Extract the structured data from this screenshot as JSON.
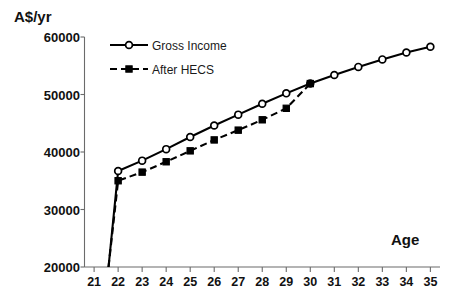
{
  "chart_data": {
    "type": "line",
    "title": "",
    "ylabel": "A$/yr",
    "xlabel": "Age",
    "x": [
      21,
      22,
      23,
      24,
      25,
      26,
      27,
      28,
      29,
      30,
      31,
      32,
      33,
      34,
      35
    ],
    "xlim": [
      20.6,
      35.4
    ],
    "ylim": [
      20000,
      60000
    ],
    "yticks": [
      20000,
      30000,
      40000,
      50000,
      60000
    ],
    "ytick_labels": [
      "20000",
      "30000",
      "40000",
      "50000",
      "60000"
    ],
    "xtick_labels": [
      "21",
      "22",
      "23",
      "24",
      "25",
      "26",
      "27",
      "28",
      "29",
      "30",
      "31",
      "32",
      "33",
      "34",
      "35"
    ],
    "grid": false,
    "legend_position": "top-left",
    "series": [
      {
        "name": "Gross Income",
        "marker": "open-circle",
        "linestyle": "solid",
        "color": "#000000",
        "x": [
          21.6,
          22,
          23,
          24,
          25,
          26,
          27,
          28,
          29,
          30,
          31,
          32,
          33,
          34,
          35
        ],
        "values": [
          20000,
          36700,
          38500,
          40500,
          42600,
          44600,
          46500,
          48400,
          50200,
          51900,
          53400,
          54800,
          56100,
          57300,
          58300
        ]
      },
      {
        "name": "After HECS",
        "marker": "filled-square",
        "linestyle": "dashed",
        "color": "#000000",
        "x": [
          21.6,
          22,
          23,
          24,
          25,
          26,
          27,
          28,
          29,
          30
        ],
        "values": [
          20000,
          35000,
          36500,
          38300,
          40200,
          42100,
          43800,
          45600,
          47600,
          51900
        ]
      }
    ],
    "legend": [
      {
        "label": "Gross Income",
        "marker": "open-circle",
        "linestyle": "solid"
      },
      {
        "label": "After HECS",
        "marker": "filled-square",
        "linestyle": "dashed"
      }
    ]
  },
  "axis": {
    "y_title": "A$/yr",
    "x_title": "Age"
  },
  "colors": {
    "ink": "#000000",
    "axis": "#6b6b6b",
    "background": "#ffffff"
  }
}
